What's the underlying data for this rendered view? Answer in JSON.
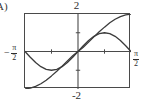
{
  "figure": {
    "part_label": "A)",
    "background_color": "#ffffff",
    "frame_color": "#4a4a4a",
    "curve_color": "#3b3b3b"
  },
  "axes": {
    "top_label": "2",
    "bottom_label": "-2",
    "left_label": {
      "minus": "−",
      "numerator": "π",
      "denominator": "2"
    },
    "right_label": {
      "minus": "",
      "numerator": "π",
      "denominator": "2"
    }
  },
  "chart_data": {
    "type": "line",
    "title": "",
    "subtitle": "",
    "xlabel": "",
    "ylabel": "",
    "xlim": [
      -1.5707963,
      1.5707963
    ],
    "ylim": [
      -2,
      2
    ],
    "xtick_labels": [
      "-π/2",
      "π/2"
    ],
    "ytick_labels": [
      "-2",
      "2"
    ],
    "xticks": [
      -0.7853982,
      0.7853982
    ],
    "yticks": [
      -1,
      1
    ],
    "grid": false,
    "legend": false,
    "legend_position": "none",
    "annotations": [],
    "series": [
      {
        "name": "curve-steep",
        "description": "odd S-shaped curve rising from lower-left corner through origin to upper-right corner",
        "x": [
          -1.5707963,
          -1.413717,
          -1.2566371,
          -1.0995574,
          -0.9424778,
          -0.7853982,
          -0.6283185,
          -0.4712389,
          -0.3141593,
          -0.1570796,
          0,
          0.1570796,
          0.3141593,
          0.4712389,
          0.6283185,
          0.7853982,
          0.9424778,
          1.0995574,
          1.2566371,
          1.413717,
          1.5707963
        ],
        "y": [
          -2,
          -1.95,
          -1.86,
          -1.72,
          -1.53,
          -1.3,
          -1.05,
          -0.78,
          -0.5,
          -0.23,
          0,
          0.23,
          0.5,
          0.78,
          1.05,
          1.3,
          1.53,
          1.72,
          1.86,
          1.95,
          2
        ]
      },
      {
        "name": "curve-shallow",
        "description": "odd sine-like curve with minimum near x = -pi/4 and maximum near x = pi/4, returning to zero at both ends",
        "x": [
          -1.5707963,
          -1.413717,
          -1.2566371,
          -1.0995574,
          -0.9424778,
          -0.7853982,
          -0.6283185,
          -0.4712389,
          -0.3141593,
          -0.1570796,
          0,
          0.1570796,
          0.3141593,
          0.4712389,
          0.6283185,
          0.7853982,
          0.9424778,
          1.0995574,
          1.2566371,
          1.413717,
          1.5707963
        ],
        "y": [
          0,
          -0.31,
          -0.59,
          -0.81,
          -0.95,
          -1,
          -0.95,
          -0.81,
          -0.59,
          -0.31,
          0,
          0.31,
          0.59,
          0.81,
          0.95,
          1,
          0.95,
          0.81,
          0.59,
          0.31,
          0
        ]
      }
    ]
  }
}
